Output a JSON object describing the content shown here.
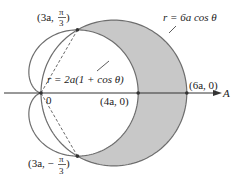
{
  "figure": {
    "polar_axis_label": "A",
    "pole_label": "0",
    "curves": [
      {
        "name": "circle",
        "equation": "r = 6a cos θ",
        "label": "r = 6a cos θ"
      },
      {
        "name": "cardioid",
        "equation": "r = 2a(1 + cos θ)",
        "label": "r = 2a(1 + cos θ)"
      }
    ],
    "points": [
      {
        "name": "upper-intersection",
        "label_pre": "(3a, ",
        "label_num": "π",
        "label_den": "3",
        "label_post": ")",
        "r_in_a": 3,
        "theta": "π/3"
      },
      {
        "name": "lower-intersection",
        "label_pre": "(3a, −",
        "label_num": "π",
        "label_den": "3",
        "label_post": ")",
        "r_in_a": 3,
        "theta": "-π/3"
      },
      {
        "name": "cardioid-vertex",
        "label": "(4a, 0)",
        "r_in_a": 4,
        "theta": "0"
      },
      {
        "name": "circle-vertex",
        "label": "(6a, 0)",
        "r_in_a": 6,
        "theta": "0"
      }
    ],
    "colors": {
      "shade": "#c8c8c8",
      "curve": "#6e6e6e",
      "axis": "#333333"
    }
  }
}
